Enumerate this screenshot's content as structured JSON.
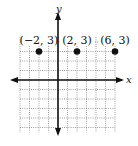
{
  "chart_data": {
    "type": "scatter",
    "title": "",
    "xlabel": "x",
    "ylabel": "y",
    "xlim": [
      -6,
      7
    ],
    "ylim": [
      -6,
      5
    ],
    "grid": true,
    "grid_style": "dotted",
    "points": [
      {
        "x": -2,
        "y": 3,
        "label": "(−2, 3)"
      },
      {
        "x": 2,
        "y": 3,
        "label": "(2, 3)"
      },
      {
        "x": 6,
        "y": 3,
        "label": "(6, 3)"
      }
    ]
  },
  "colors": {
    "axis": "#111111",
    "grid": "#777777",
    "point": "#111111"
  }
}
